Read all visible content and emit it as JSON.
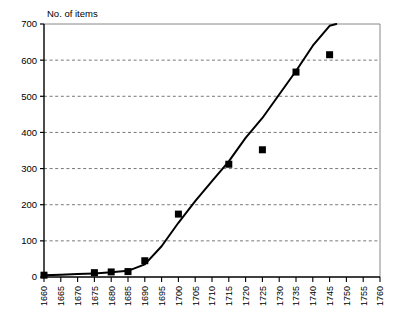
{
  "chart_data": {
    "type": "scatter",
    "title": "",
    "ylabel": "No. of items",
    "xlabel": "",
    "xlim": [
      1660,
      1760
    ],
    "ylim": [
      0,
      700
    ],
    "ytick_step": 100,
    "xtick_step": 5,
    "grid": true,
    "grid_style": "dashed-horizontal",
    "legend": "none",
    "yticks": [
      "0",
      "100",
      "200",
      "300",
      "400",
      "500",
      "600",
      "700"
    ],
    "xticks": [
      "1660",
      "1665",
      "1670",
      "1675",
      "1680",
      "1685",
      "1690",
      "1695",
      "1700",
      "1705",
      "1710",
      "1715",
      "1720",
      "1725",
      "1730",
      "1735",
      "1740",
      "1745",
      "1750",
      "1755",
      "1760"
    ],
    "marker_shape": "square",
    "marker_color": "#000000",
    "line_color": "#000000",
    "series": [
      {
        "name": "No. of items",
        "marker": "square",
        "x": [
          1660,
          1675,
          1680,
          1685,
          1690,
          1700,
          1715,
          1725,
          1735,
          1745
        ],
        "values": [
          5,
          12,
          14,
          15,
          45,
          174,
          312,
          352,
          567,
          615
        ]
      },
      {
        "name": "fitted curve",
        "type": "line",
        "x": [
          1660,
          1665,
          1670,
          1675,
          1680,
          1685,
          1690,
          1695,
          1700,
          1705,
          1710,
          1715,
          1720,
          1725,
          1730,
          1735,
          1740,
          1745,
          1747
        ],
        "values": [
          5,
          6,
          8,
          10,
          13,
          17,
          35,
          85,
          150,
          210,
          265,
          320,
          385,
          440,
          505,
          570,
          640,
          695,
          700
        ]
      }
    ]
  }
}
